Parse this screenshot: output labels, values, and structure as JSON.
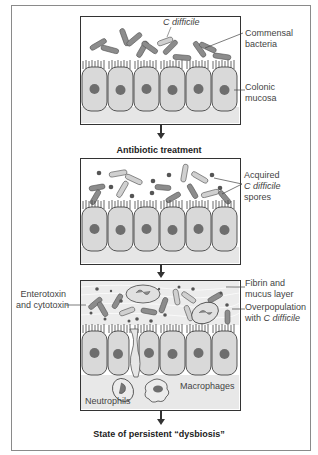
{
  "panels": [
    {
      "id": "normal",
      "labels": {
        "c_difficile": "C difficile",
        "commensal": "Commensal bacteria",
        "commensal_line1": "Commensal",
        "commensal_line2": "bacteria",
        "mucosa_line1": "Colonic",
        "mucosa_line2": "mucosa"
      }
    },
    {
      "id": "post-antibiotic",
      "labels": {
        "spores_line1": "Acquired",
        "spores_line2": "C difficile",
        "spores_line3": "spores"
      }
    },
    {
      "id": "dysbiosis",
      "labels": {
        "toxin_line1": "Enterotoxin",
        "toxin_line2": "and cytotoxin",
        "fibrin_line1": "Fibrin and",
        "fibrin_line2": "mucus layer",
        "overpop_line1": "Overpopulation",
        "overpop_line2_prefix": "with ",
        "overpop_line2_italic": "C difficile",
        "macrophages": "Macrophages",
        "neutrophils": "Neutrophils"
      }
    }
  ],
  "captions": {
    "step1": "Antibiotic treatment",
    "step2": "State of persistent “dysbiosis”"
  },
  "colors": {
    "cell_fill": "#d9d9d9",
    "nucleus": "#6e6e6e",
    "bacteria": "#8c8c8c",
    "c_difficile": "#d0d0d0",
    "border": "#333333"
  }
}
